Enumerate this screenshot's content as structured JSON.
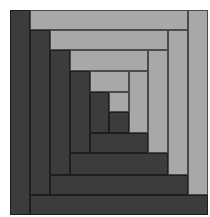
{
  "diagram": {
    "type": "log-cabin-quilt-block",
    "colors": {
      "dark": "#3c3c3c",
      "light": "#a8a8a8",
      "background": "#ffffff"
    },
    "strips": [
      {
        "name": "ring0-left-dark",
        "tone": "dark",
        "x": 10,
        "y": 10,
        "w": 20,
        "h": 205
      },
      {
        "name": "ring0-top-light",
        "tone": "light",
        "x": 30,
        "y": 10,
        "w": 158,
        "h": 20
      },
      {
        "name": "ring0-right-light",
        "tone": "light",
        "x": 188,
        "y": 10,
        "w": 20,
        "h": 185
      },
      {
        "name": "ring0-bottom-dark",
        "tone": "dark",
        "x": 30,
        "y": 195,
        "w": 178,
        "h": 20
      },
      {
        "name": "ring1-left-dark",
        "tone": "dark",
        "x": 30,
        "y": 30,
        "w": 20,
        "h": 165
      },
      {
        "name": "ring1-top-light",
        "tone": "light",
        "x": 50,
        "y": 30,
        "w": 118,
        "h": 20
      },
      {
        "name": "ring1-right-light",
        "tone": "light",
        "x": 168,
        "y": 30,
        "w": 20,
        "h": 145
      },
      {
        "name": "ring1-bottom-dark",
        "tone": "dark",
        "x": 50,
        "y": 175,
        "w": 138,
        "h": 20
      },
      {
        "name": "ring2-left-dark",
        "tone": "dark",
        "x": 50,
        "y": 50,
        "w": 20,
        "h": 125
      },
      {
        "name": "ring2-top-light",
        "tone": "light",
        "x": 70,
        "y": 50,
        "w": 78,
        "h": 21
      },
      {
        "name": "ring2-right-light",
        "tone": "light",
        "x": 148,
        "y": 50,
        "w": 20,
        "h": 103
      },
      {
        "name": "ring2-bottom-dark",
        "tone": "dark",
        "x": 70,
        "y": 153,
        "w": 98,
        "h": 22
      },
      {
        "name": "ring3-left-dark",
        "tone": "dark",
        "x": 70,
        "y": 71,
        "w": 20,
        "h": 82
      },
      {
        "name": "ring3-top-light",
        "tone": "light",
        "x": 90,
        "y": 71,
        "w": 39,
        "h": 21
      },
      {
        "name": "ring3-right-light",
        "tone": "light",
        "x": 129,
        "y": 71,
        "w": 19,
        "h": 62
      },
      {
        "name": "ring3-bottom-dark",
        "tone": "dark",
        "x": 90,
        "y": 133,
        "w": 58,
        "h": 20
      },
      {
        "name": "center-left-dark",
        "tone": "dark",
        "x": 90,
        "y": 92,
        "w": 19,
        "h": 41
      },
      {
        "name": "center-light-square",
        "tone": "light",
        "x": 109,
        "y": 92,
        "w": 20,
        "h": 20
      },
      {
        "name": "center-dark-square",
        "tone": "dark",
        "x": 109,
        "y": 112,
        "w": 20,
        "h": 21
      }
    ]
  }
}
